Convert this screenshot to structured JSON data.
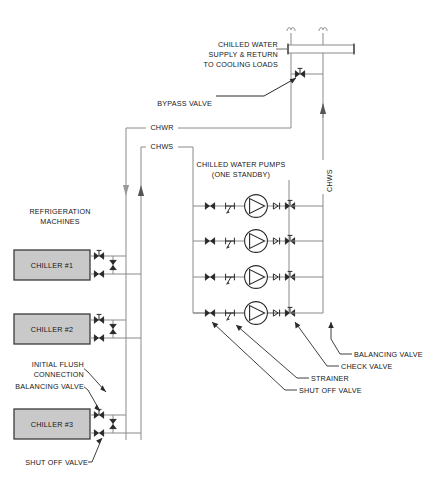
{
  "diagram": {
    "background": "#ffffff",
    "line_color": "#6f6f6f",
    "dark_line_color": "#2a2a2a",
    "chiller_fill": "#c9c9c9",
    "chiller_stroke": "#3b3b3b",
    "text_color": "#161616"
  },
  "labels": {
    "chilled_water_header": "CHILLED WATER",
    "supply_return": "SUPPLY & RETURN",
    "to_cooling_loads": "TO COOLING LOADS",
    "bypass_valve": "BYPASS VALVE",
    "chwr": "CHWR",
    "chws": "CHWS",
    "chws_riser": "CHWS",
    "pumps_title": "CHILLED WATER PUMPS",
    "pumps_sub": "(ONE STANDBY)",
    "refrigeration": "REFRIGERATION",
    "machines": "MACHINES",
    "initial_flush": "INITIAL FLUSH",
    "connection": "CONNECTION",
    "balancing_valve_left": "BALANCING VALVE",
    "shut_off_valve_left": "SHUT OFF VALVE",
    "balancing_valve": "BALANCING VALVE",
    "check_valve": "CHECK VALVE",
    "strainer": "STRAINER",
    "shut_off_valve": "SHUT OFF VALVE"
  },
  "chillers": [
    {
      "name": "CHILLER #1"
    },
    {
      "name": "CHILLER #2"
    },
    {
      "name": "CHILLER #3"
    }
  ],
  "pumps": {
    "count": 4,
    "components": [
      "shut-off-valve",
      "strainer",
      "pump",
      "check-valve",
      "balancing-valve"
    ]
  },
  "flow": {
    "chwr_direction": "down",
    "chws_direction": "up",
    "chws_riser_direction": "up"
  }
}
